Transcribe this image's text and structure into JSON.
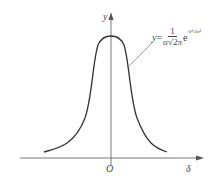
{
  "diagram": {
    "type": "normal distribution curve",
    "axes": {
      "x_label": "δ",
      "y_label": "y",
      "origin_label": "O"
    },
    "formula": {
      "lhs": "y",
      "equals": "=",
      "numerator": "1",
      "denominator": "σ√2π",
      "base": "e",
      "exponent": "-δ²/2σ²"
    },
    "colors": {
      "curve": "#333333",
      "axes": "#555555",
      "leader": "#777777"
    }
  }
}
